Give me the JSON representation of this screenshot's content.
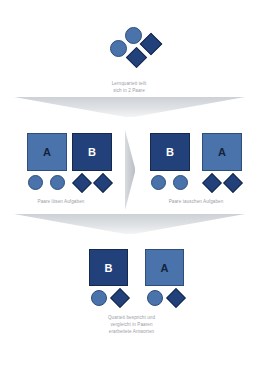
{
  "diagram": {
    "title": "Lernquartett",
    "background_color": "#ffffff",
    "palette": {
      "light_blue": "#4a73ab",
      "dark_navy": "#22417a",
      "light_border": "#2e4d78",
      "dark_border": "#15294d",
      "connector_gray": "#d3d7db",
      "caption_gray": "#9aa0a6"
    },
    "stages": [
      {
        "id": "stage-quartet",
        "caption": "Lernquartett teilt\nsich in 2 Paare",
        "shapes": [
          {
            "type": "circle",
            "color": "light_blue"
          },
          {
            "type": "circle",
            "color": "light_blue"
          },
          {
            "type": "diamond",
            "color": "dark_navy"
          },
          {
            "type": "diamond",
            "color": "dark_navy"
          }
        ]
      },
      {
        "id": "stage-pairs-solve",
        "caption": "Paare lösen Aufgaben",
        "groups": [
          {
            "label": "A",
            "tone": "light",
            "member_shape": "circle",
            "member_count": 2
          },
          {
            "label": "B",
            "tone": "dark",
            "member_shape": "diamond",
            "member_count": 2
          }
        ]
      },
      {
        "id": "stage-pairs-exchange",
        "caption": "Paare tauschen Aufgaben",
        "groups": [
          {
            "label": "B",
            "tone": "dark",
            "member_shape": "circle",
            "member_count": 2
          },
          {
            "label": "A",
            "tone": "light",
            "member_shape": "diamond",
            "member_count": 2
          }
        ]
      },
      {
        "id": "stage-quartet-discuss",
        "caption": "Quartett bespricht und\nvergleicht in Paaren\nerarbeitete Antworten",
        "groups": [
          {
            "label": "B",
            "tone": "dark",
            "member_shapes": [
              "circle",
              "diamond"
            ]
          },
          {
            "label": "A",
            "tone": "light",
            "member_shapes": [
              "circle",
              "diamond"
            ]
          }
        ]
      }
    ],
    "connectors": [
      {
        "id": "connector-top",
        "kind": "chevron-down"
      },
      {
        "id": "connector-middle",
        "kind": "arrow-right"
      },
      {
        "id": "connector-bottom",
        "kind": "chevron-down"
      }
    ]
  }
}
